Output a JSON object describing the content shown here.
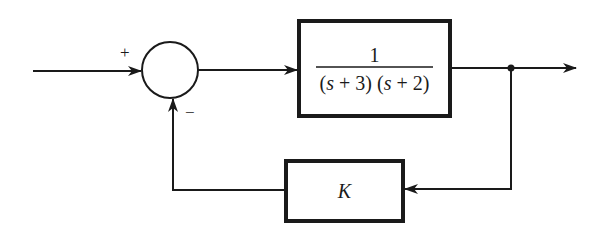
{
  "diagram": {
    "type": "feedback-control-block-diagram",
    "summing_junction": {
      "plus_sign": "+",
      "minus_sign": "−"
    },
    "forward_block": {
      "numerator": "1",
      "denominator": "(s + 3) (s + 2)",
      "denominator_parts": [
        "(",
        "s",
        " + 3) (",
        "s",
        " + 2)"
      ]
    },
    "feedback_block": {
      "label": "K"
    },
    "colors": {
      "line": "#1a1a1a",
      "background": "#ffffff"
    }
  }
}
